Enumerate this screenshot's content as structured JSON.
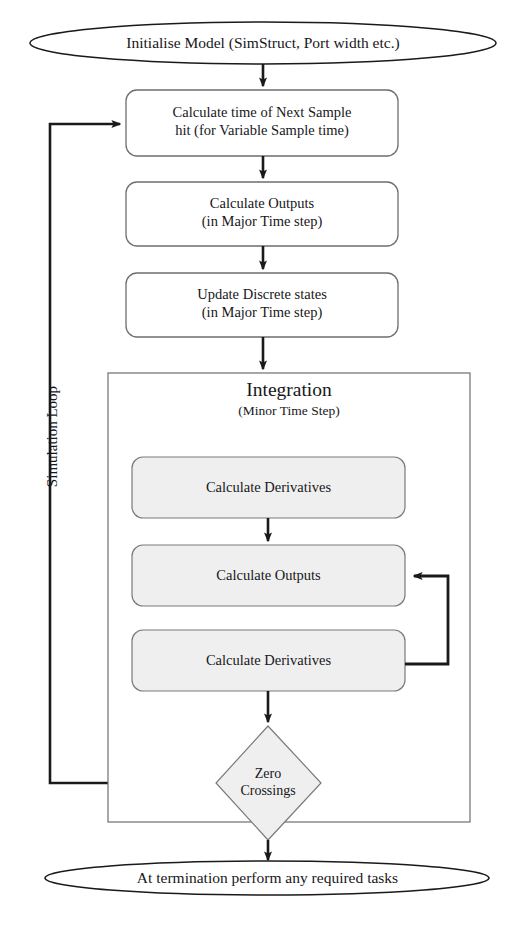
{
  "diagram": {
    "loop_label": "Simulation Loop",
    "colors": {
      "stroke": "#1a1a1a",
      "thin_stroke": "#6e6e6e",
      "fill_white": "#ffffff",
      "fill_gray": "#efefef",
      "text": "#17171a"
    },
    "start": {
      "shape": "ellipse",
      "label": "Initialise Model (SimStruct, Port width etc.)"
    },
    "steps": [
      {
        "id": "next-sample-hit",
        "shape": "rounded-rect",
        "label": "Calculate time of Next Sample\nhit (for Variable Sample time)"
      },
      {
        "id": "calculate-outputs-major",
        "shape": "rounded-rect",
        "label": "Calculate Outputs\n(in Major Time step)"
      },
      {
        "id": "update-discrete-states",
        "shape": "rounded-rect",
        "label": "Update Discrete states\n(in Major Time step)"
      }
    ],
    "integration": {
      "title": "Integration",
      "subtitle": "(Minor Time Step)",
      "steps": [
        {
          "id": "calculate-derivatives-1",
          "shape": "rounded-rect",
          "label": "Calculate Derivatives"
        },
        {
          "id": "calculate-outputs-minor",
          "shape": "rounded-rect",
          "label": "Calculate Outputs"
        },
        {
          "id": "calculate-derivatives-2",
          "shape": "rounded-rect",
          "label": "Calculate Derivatives"
        }
      ],
      "decision": {
        "id": "zero-crossings",
        "shape": "diamond",
        "label": "Zero\nCrossings"
      }
    },
    "end": {
      "shape": "ellipse",
      "label": "At termination perform any required tasks"
    }
  }
}
